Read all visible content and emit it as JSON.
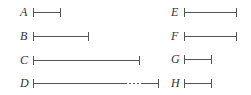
{
  "diagram": {
    "title": "",
    "stroke_color": "#555555",
    "segments": [
      {
        "label": "A",
        "label_x": 20,
        "y": 12,
        "x1": 33,
        "x2": 60,
        "dashed": null
      },
      {
        "label": "B",
        "label_x": 20,
        "y": 36,
        "x1": 33,
        "x2": 88,
        "dashed": null
      },
      {
        "label": "C",
        "label_x": 20,
        "y": 60,
        "x1": 33,
        "x2": 139,
        "dashed": null
      },
      {
        "label": "D",
        "label_x": 20,
        "y": 83,
        "x1": 33,
        "x2": 158,
        "dashed": [
          125,
          142
        ]
      },
      {
        "label": "E",
        "label_x": 171,
        "y": 12,
        "x1": 184,
        "x2": 236,
        "dashed": null
      },
      {
        "label": "F",
        "label_x": 171,
        "y": 36,
        "x1": 184,
        "x2": 236,
        "dashed": null
      },
      {
        "label": "G",
        "label_x": 171,
        "y": 59,
        "x1": 184,
        "x2": 211,
        "dashed": null
      },
      {
        "label": "H",
        "label_x": 171,
        "y": 83,
        "x1": 184,
        "x2": 211,
        "dashed": null
      }
    ]
  }
}
